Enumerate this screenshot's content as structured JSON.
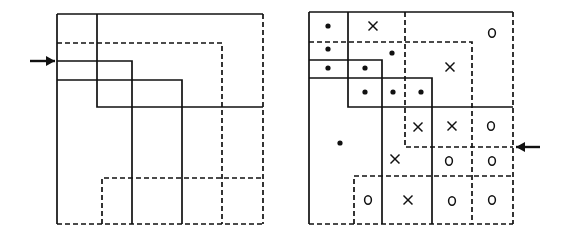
{
  "diagram": {
    "stroke_color": "#111111",
    "background": "#ffffff",
    "left_panel": {
      "name": "overlapping-regions",
      "outer_box": {
        "x1": 57,
        "y1": 14,
        "x2": 263,
        "y2": 224
      },
      "solid_lines": [
        [
          [
            57,
            14
          ],
          [
            263,
            14
          ]
        ],
        [
          [
            57,
            14
          ],
          [
            57,
            224
          ]
        ],
        [
          [
            97,
            14
          ],
          [
            97,
            107
          ],
          [
            263,
            107
          ]
        ],
        [
          [
            57,
            61
          ],
          [
            132,
            61
          ],
          [
            132,
            224
          ]
        ],
        [
          [
            57,
            80
          ],
          [
            182,
            80
          ],
          [
            182,
            224
          ]
        ]
      ],
      "dashed_lines": [
        [
          [
            263,
            14
          ],
          [
            263,
            224
          ]
        ],
        [
          [
            57,
            224
          ],
          [
            263,
            224
          ]
        ],
        [
          [
            57,
            43
          ],
          [
            222,
            43
          ],
          [
            222,
            224
          ]
        ],
        [
          [
            102,
            224
          ],
          [
            102,
            178
          ],
          [
            263,
            178
          ]
        ]
      ],
      "arrow": {
        "x1": 30,
        "y1": 61,
        "x2": 55,
        "y2": 61,
        "direction": "right"
      }
    },
    "right_panel": {
      "name": "classified-regions",
      "solid_lines": [
        [
          [
            309,
            12
          ],
          [
            513,
            12
          ]
        ],
        [
          [
            309,
            12
          ],
          [
            309,
            224
          ]
        ],
        [
          [
            348,
            12
          ],
          [
            348,
            107
          ],
          [
            513,
            107
          ]
        ],
        [
          [
            309,
            60
          ],
          [
            382,
            60
          ],
          [
            382,
            224
          ]
        ],
        [
          [
            309,
            78
          ],
          [
            432,
            78
          ],
          [
            432,
            224
          ]
        ]
      ],
      "dashed_lines": [
        [
          [
            513,
            12
          ],
          [
            513,
            224
          ]
        ],
        [
          [
            309,
            224
          ],
          [
            513,
            224
          ]
        ],
        [
          [
            405,
            12
          ],
          [
            405,
            147
          ],
          [
            513,
            147
          ]
        ],
        [
          [
            309,
            42
          ],
          [
            472,
            42
          ],
          [
            472,
            224
          ]
        ],
        [
          [
            354,
            224
          ],
          [
            354,
            176
          ],
          [
            513,
            176
          ]
        ]
      ],
      "arrow": {
        "x1": 540,
        "y1": 147,
        "x2": 516,
        "y2": 147,
        "direction": "left"
      },
      "symbols": [
        {
          "type": "dot",
          "x": 328,
          "y": 26
        },
        {
          "type": "x",
          "x": 373,
          "y": 26
        },
        {
          "type": "o",
          "x": 492,
          "y": 33
        },
        {
          "type": "dot",
          "x": 328,
          "y": 49
        },
        {
          "type": "dot",
          "x": 392,
          "y": 53
        },
        {
          "type": "dot",
          "x": 328,
          "y": 68
        },
        {
          "type": "dot",
          "x": 365,
          "y": 68
        },
        {
          "type": "x",
          "x": 450,
          "y": 67
        },
        {
          "type": "dot",
          "x": 365,
          "y": 92
        },
        {
          "type": "dot",
          "x": 393,
          "y": 92
        },
        {
          "type": "dot",
          "x": 421,
          "y": 92
        },
        {
          "type": "x",
          "x": 418,
          "y": 127
        },
        {
          "type": "x",
          "x": 452,
          "y": 126
        },
        {
          "type": "o",
          "x": 491,
          "y": 126
        },
        {
          "type": "dot",
          "x": 340,
          "y": 143
        },
        {
          "type": "x",
          "x": 395,
          "y": 159
        },
        {
          "type": "o",
          "x": 449,
          "y": 161
        },
        {
          "type": "o",
          "x": 492,
          "y": 161
        },
        {
          "type": "o",
          "x": 368,
          "y": 200
        },
        {
          "type": "x",
          "x": 408,
          "y": 200
        },
        {
          "type": "o",
          "x": 452,
          "y": 201
        },
        {
          "type": "o",
          "x": 492,
          "y": 200
        }
      ]
    }
  }
}
